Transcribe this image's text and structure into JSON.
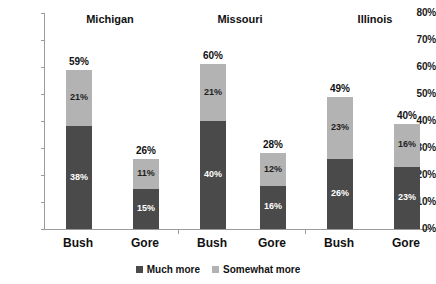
{
  "chart_data": {
    "type": "bar",
    "subtype": "stacked-bar-grouped",
    "title": "",
    "xlabel": "",
    "ylabel": "",
    "ylim": [
      0,
      80
    ],
    "grid": false,
    "ytick_labels": [
      "80%",
      "70%",
      "60%",
      "50%",
      "40%",
      "30%",
      "20%",
      "10%",
      "0%"
    ],
    "ytick_values": [
      80,
      70,
      60,
      50,
      40,
      30,
      20,
      10,
      0
    ],
    "groups": [
      "Michigan",
      "Missouri",
      "Illinois"
    ],
    "categories": [
      "Bush",
      "Gore",
      "Bush",
      "Gore",
      "Bush",
      "Gore"
    ],
    "series": [
      {
        "name": "Much more",
        "color": "#4a4a4a",
        "values": [
          38,
          15,
          40,
          16,
          26,
          23
        ],
        "labels": [
          "38%",
          "15%",
          "40%",
          "16%",
          "26%",
          "23%"
        ]
      },
      {
        "name": "Somewhat more",
        "color": "#b3b3b3",
        "values": [
          21,
          11,
          21,
          12,
          23,
          16
        ],
        "labels": [
          "21%",
          "11%",
          "21%",
          "12%",
          "23%",
          "16%"
        ]
      }
    ],
    "totals": [
      59,
      26,
      60,
      28,
      49,
      40
    ],
    "total_labels": [
      "59%",
      "26%",
      "60%",
      "28%",
      "49%",
      "40%"
    ],
    "legend": {
      "position": "bottom-center",
      "entries": [
        {
          "label": "Much more",
          "color": "#4a4a4a"
        },
        {
          "label": "Somewhat more",
          "color": "#b3b3b3"
        }
      ]
    },
    "axis_color": "#9a9a9a",
    "background": "#ffffff"
  },
  "axis": {
    "ticks": [
      {
        "label": "80%"
      },
      {
        "label": "70%"
      },
      {
        "label": "60%"
      },
      {
        "label": "50%"
      },
      {
        "label": "40%"
      },
      {
        "label": "30%"
      },
      {
        "label": "20%"
      },
      {
        "label": "10%"
      },
      {
        "label": "0%"
      }
    ]
  },
  "titles": [
    {
      "label": "Michigan"
    },
    {
      "label": "Missouri"
    },
    {
      "label": "Illinois"
    }
  ],
  "bars": [
    {
      "cat": "Bush",
      "total": "59%",
      "much": "38%",
      "somewhat": "21%"
    },
    {
      "cat": "Gore",
      "total": "26%",
      "much": "15%",
      "somewhat": "11%"
    },
    {
      "cat": "Bush",
      "total": "60%",
      "much": "40%",
      "somewhat": "21%"
    },
    {
      "cat": "Gore",
      "total": "28%",
      "much": "16%",
      "somewhat": "12%"
    },
    {
      "cat": "Bush",
      "total": "49%",
      "much": "26%",
      "somewhat": "23%"
    },
    {
      "cat": "Gore",
      "total": "40%",
      "much": "23%",
      "somewhat": "16%"
    }
  ],
  "legend": {
    "items": [
      {
        "label": "Much more"
      },
      {
        "label": "Somewhat more"
      }
    ]
  }
}
